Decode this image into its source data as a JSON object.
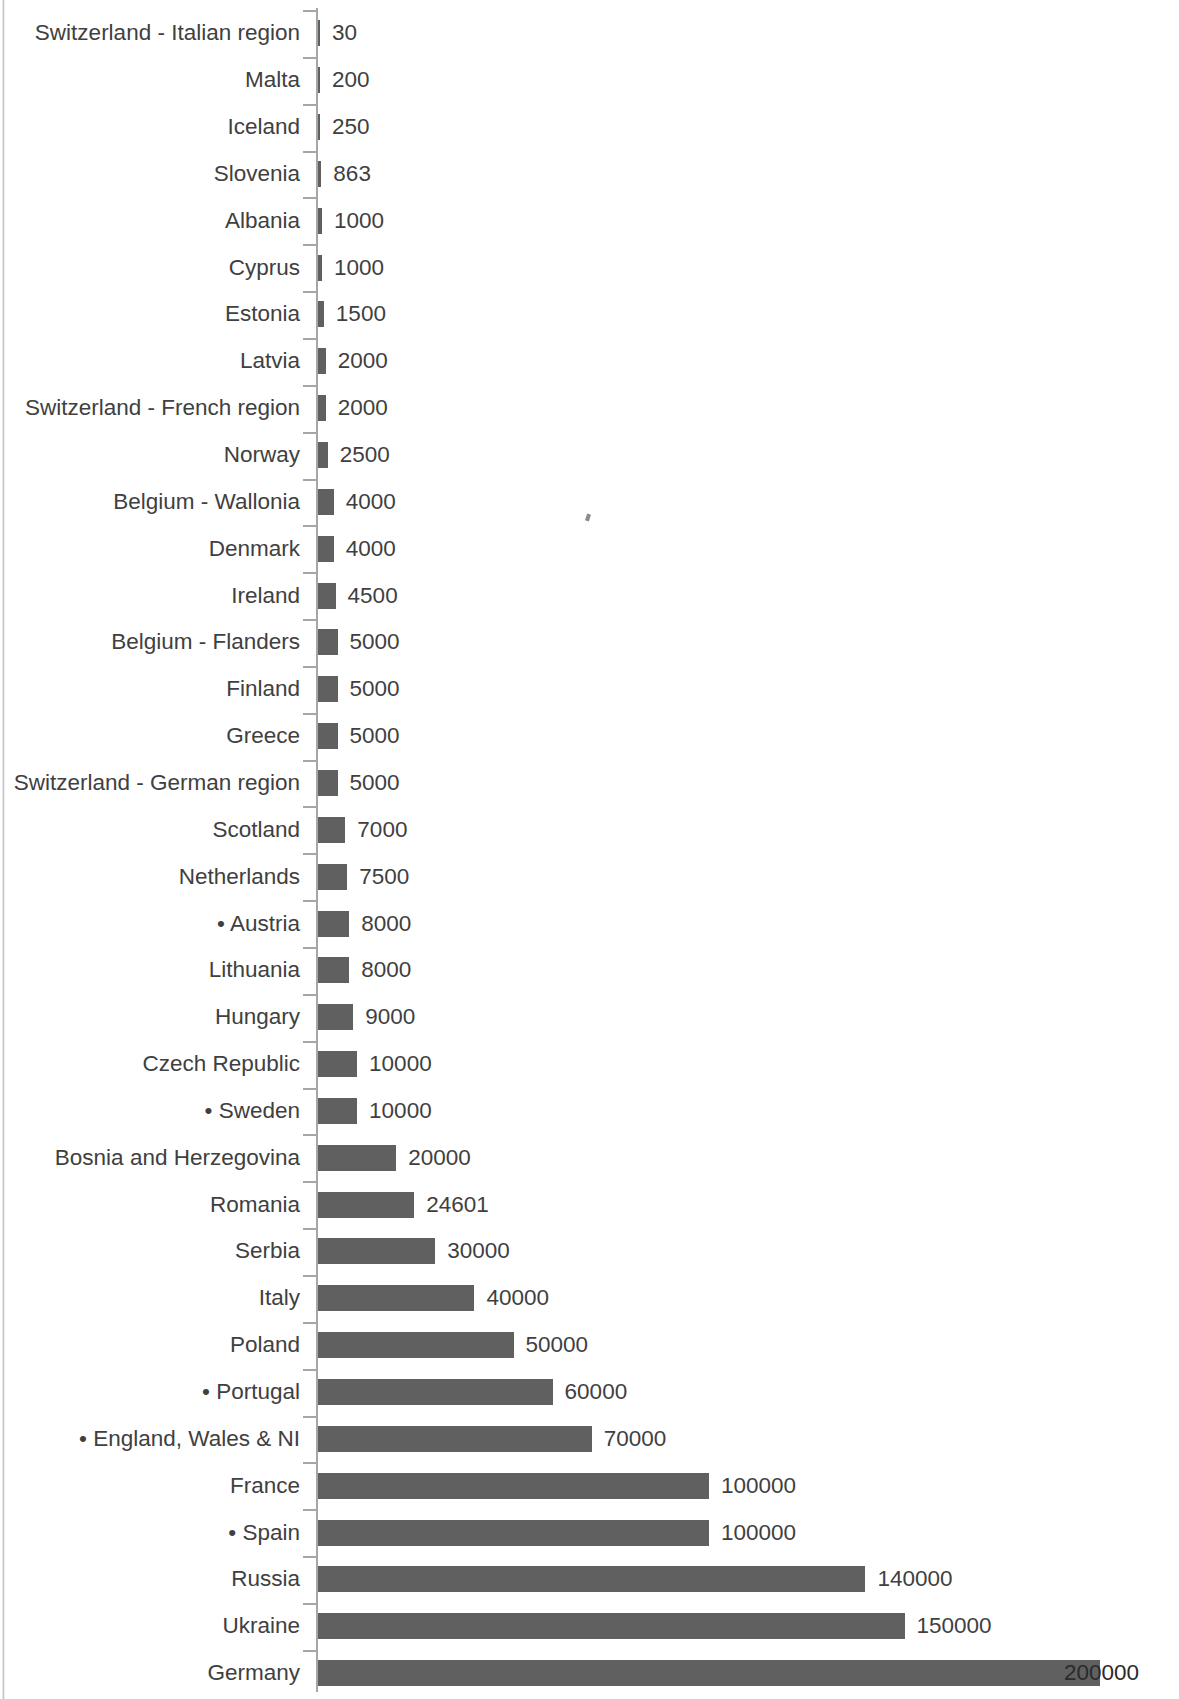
{
  "chart_data": {
    "type": "bar",
    "orientation": "horizontal",
    "title": "",
    "subtitle": "",
    "xlabel": "",
    "ylabel": "",
    "grid": false,
    "legend": null,
    "axis": {
      "category_axis": "y",
      "value_axis": "x",
      "xlim": [
        0,
        200000
      ],
      "value_axis_visible": false,
      "tick_marks": true
    },
    "data_labels": true,
    "bar_color": "#606060",
    "axis_color": "#a6a6a6",
    "text_color": "#404040",
    "categories": [
      "Switzerland - Italian region",
      "Malta",
      "Iceland",
      "Slovenia",
      "Albania",
      "Cyprus",
      "Estonia",
      "Latvia",
      "Switzerland - French region",
      "Norway",
      "Belgium - Wallonia",
      "Denmark",
      "Ireland",
      "Belgium - Flanders",
      "Finland",
      "Greece",
      "Switzerland - German region",
      "Scotland",
      "Netherlands",
      "• Austria",
      "Lithuania",
      "Hungary",
      "Czech Republic",
      "• Sweden",
      "Bosnia and Herzegovina",
      "Romania",
      "Serbia",
      "Italy",
      "Poland",
      "• Portugal",
      "• England, Wales & NI",
      "France",
      "• Spain",
      "Russia",
      "Ukraine",
      "Germany"
    ],
    "values": [
      30,
      200,
      250,
      863,
      1000,
      1000,
      1500,
      2000,
      2000,
      2500,
      4000,
      4000,
      4500,
      5000,
      5000,
      5000,
      5000,
      7000,
      7500,
      8000,
      8000,
      9000,
      10000,
      10000,
      20000,
      24601,
      30000,
      40000,
      50000,
      60000,
      70000,
      100000,
      100000,
      140000,
      150000,
      200000
    ],
    "value_labels": [
      "30",
      "200",
      "250",
      "863",
      "1000",
      "1000",
      "1500",
      "2000",
      "2000",
      "2500",
      "4000",
      "4000",
      "4500",
      "5000",
      "5000",
      "5000",
      "5000",
      "7000",
      "7500",
      "8000",
      "8000",
      "9000",
      "10000",
      "10000",
      "20000",
      "24601",
      "30000",
      "40000",
      "50000",
      "60000",
      "70000",
      "100000",
      "100000",
      "140000",
      "150000",
      "200000"
    ]
  }
}
